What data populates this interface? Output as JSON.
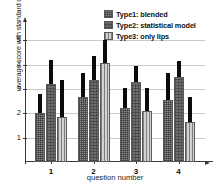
{
  "chart_data": {
    "type": "bar",
    "title": "",
    "xlabel": "question number",
    "ylabel": "average score with standard deviation",
    "categories": [
      "1",
      "2",
      "3",
      "4"
    ],
    "ylim": [
      0,
      5.5
    ],
    "yticks": [
      "1",
      "2",
      "3",
      "4",
      "5"
    ],
    "ytick_values": [
      1,
      2,
      3,
      4,
      5
    ],
    "grid": true,
    "legend_position": "top-right",
    "error_bars": "standard deviation (upper whisker shown)",
    "series": [
      {
        "name": "Type1: blended",
        "key": "type1",
        "pattern": "checkered-gray",
        "color": "#8f8f8f",
        "values": [
          2.0,
          2.65,
          2.2,
          2.55
        ],
        "err_top": [
          2.8,
          3.65,
          3.05,
          3.65
        ]
      },
      {
        "name": "Type2: statistical model",
        "key": "type2",
        "pattern": "dense-dark-gray",
        "color": "#6e6e6e",
        "values": [
          3.2,
          3.35,
          3.3,
          3.5
        ],
        "err_top": [
          4.2,
          4.35,
          3.95,
          4.15
        ]
      },
      {
        "name": "Type3: only lips",
        "key": "type3",
        "pattern": "vertical-lines-light",
        "color": "#d2d2d2",
        "values": [
          1.85,
          4.05,
          2.1,
          1.65
        ],
        "err_top": [
          3.35,
          5.0,
          3.05,
          2.65
        ]
      }
    ]
  },
  "legend": {
    "items": [
      {
        "label": "Type1: blended"
      },
      {
        "label": "Type2: statistical model"
      },
      {
        "label": "Type3: only lips"
      }
    ]
  },
  "axes": {
    "x_title": "question number",
    "y_title": "average score with standard deviation"
  }
}
